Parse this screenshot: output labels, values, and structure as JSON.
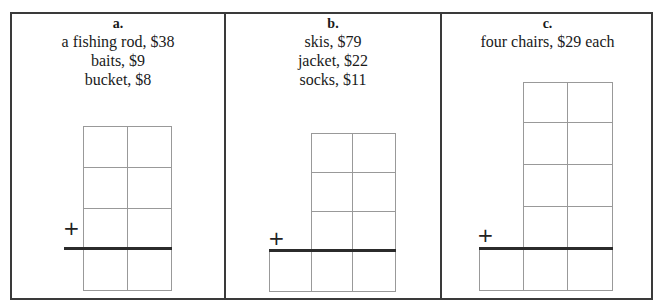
{
  "panels": [
    {
      "label": "a.",
      "lines": [
        "a fishing rod, $38",
        "baits, $9",
        "bucket, $8"
      ],
      "grid": {
        "columns": 2,
        "addend_rows": 3,
        "answer_columns": 2
      },
      "operator": "+"
    },
    {
      "label": "b.",
      "lines": [
        "skis, $79",
        "jacket, $22",
        "socks, $11"
      ],
      "grid": {
        "columns": 2,
        "addend_rows": 3,
        "answer_columns": 3
      },
      "operator": "+"
    },
    {
      "label": "c.",
      "lines": [
        "four chairs, $29 each"
      ],
      "grid": {
        "columns": 2,
        "addend_rows": 4,
        "answer_columns": 3
      },
      "operator": "+"
    }
  ],
  "colors": {
    "frame": "#3a3a3a",
    "grid_line": "#999999",
    "sum_line": "#2b2b2b"
  }
}
